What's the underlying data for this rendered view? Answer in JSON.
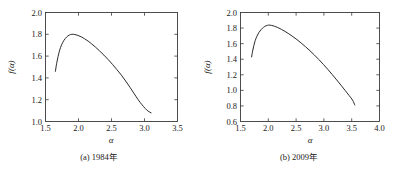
{
  "figure": {
    "background_color": "#ffffff",
    "curve_color": "#2b2b2b",
    "axis_color": "#3a3a3a"
  },
  "chart_data": [
    {
      "type": "line",
      "panel_id": "a",
      "title": "(a) 1984年",
      "caption_prefix": "(a)",
      "caption_year": "1984年",
      "xlabel": "α",
      "ylabel": "f(α)",
      "xlim": [
        1.5,
        3.5
      ],
      "ylim": [
        1.0,
        2.0
      ],
      "xticks": [
        1.5,
        2.0,
        2.5,
        3.0,
        3.5
      ],
      "xtick_labels": [
        "1.5",
        "2.0",
        "2.5",
        "3.0",
        "3.5"
      ],
      "yticks": [
        1.0,
        1.2,
        1.4,
        1.6,
        1.8,
        2.0
      ],
      "ytick_labels": [
        "1.0",
        "1.2",
        "1.4",
        "1.6",
        "1.8",
        "2.0"
      ],
      "grid": false,
      "legend": "none",
      "x": [
        1.65,
        1.668,
        1.69,
        1.715,
        1.745,
        1.78,
        1.82,
        1.86,
        1.9,
        1.945,
        1.99,
        2.04,
        2.09,
        2.145,
        2.2,
        2.26,
        2.32,
        2.385,
        2.45,
        2.515,
        2.58,
        2.65,
        2.715,
        2.78,
        2.845,
        2.905,
        2.96,
        3.01,
        3.055,
        3.1
      ],
      "y": [
        1.46,
        1.53,
        1.595,
        1.655,
        1.705,
        1.745,
        1.775,
        1.793,
        1.8,
        1.798,
        1.79,
        1.777,
        1.76,
        1.738,
        1.712,
        1.681,
        1.647,
        1.609,
        1.568,
        1.524,
        1.477,
        1.425,
        1.371,
        1.314,
        1.254,
        1.199,
        1.155,
        1.12,
        1.095,
        1.08
      ]
    },
    {
      "type": "line",
      "panel_id": "b",
      "title": "(b) 2009年",
      "caption_prefix": "(b)",
      "caption_year": "2009年",
      "xlabel": "α",
      "ylabel": "f(α)",
      "xlim": [
        1.5,
        4.0
      ],
      "ylim": [
        0.6,
        2.0
      ],
      "xticks": [
        1.5,
        2.0,
        2.5,
        3.0,
        3.5,
        4.0
      ],
      "xtick_labels": [
        "1.5",
        "2.0",
        "2.5",
        "3.0",
        "3.5",
        "4.0"
      ],
      "yticks": [
        0.6,
        0.8,
        1.0,
        1.2,
        1.4,
        1.6,
        1.8,
        2.0
      ],
      "ytick_labels": [
        "0.6",
        "0.8",
        "1.0",
        "1.2",
        "1.4",
        "1.6",
        "1.8",
        "2.0"
      ],
      "grid": false,
      "legend": "none",
      "x": [
        1.7,
        1.718,
        1.74,
        1.765,
        1.795,
        1.83,
        1.87,
        1.915,
        1.96,
        2.005,
        2.055,
        2.11,
        2.17,
        2.235,
        2.3,
        2.37,
        2.44,
        2.515,
        2.59,
        2.67,
        2.75,
        2.83,
        2.91,
        2.99,
        3.07,
        3.15,
        3.23,
        3.31,
        3.385,
        3.455,
        3.515,
        3.555
      ],
      "y": [
        1.43,
        1.505,
        1.575,
        1.64,
        1.695,
        1.742,
        1.78,
        1.81,
        1.83,
        1.838,
        1.835,
        1.824,
        1.807,
        1.784,
        1.757,
        1.726,
        1.691,
        1.652,
        1.609,
        1.56,
        1.508,
        1.453,
        1.395,
        1.334,
        1.27,
        1.203,
        1.134,
        1.064,
        0.996,
        0.933,
        0.875,
        0.812
      ]
    }
  ]
}
